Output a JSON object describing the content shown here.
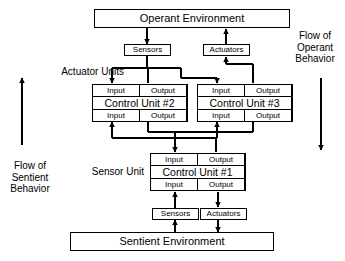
{
  "diagram": {
    "type": "block-diagram",
    "background_color": "#ffffff",
    "line_color": "#000000"
  },
  "environments": {
    "operant": "Operant Environment",
    "sentient": "Sentient Environment"
  },
  "interfaces": {
    "operant_sensors": "Sensors",
    "operant_actuators": "Actuators",
    "sentient_sensors": "Sensors",
    "sentient_actuators": "Actuators"
  },
  "control_units": [
    {
      "id": "cu2",
      "title": "Control Unit #2",
      "top_input": "Input",
      "top_output": "Output",
      "bottom_input": "Input",
      "bottom_output": "Output"
    },
    {
      "id": "cu3",
      "title": "Control Unit #3",
      "top_input": "Input",
      "top_output": "Output",
      "bottom_input": "Input",
      "bottom_output": "Output"
    },
    {
      "id": "cu1",
      "title": "Control Unit #1",
      "top_input": "Input",
      "top_output": "Output",
      "bottom_input": "Input",
      "bottom_output": "Output"
    }
  ],
  "labels": {
    "actuator_units": "Actuator Units",
    "sensor_unit": "Sensor Unit",
    "flow_operant": "Flow of\nOperant\nBehavior",
    "flow_sentient": "Flow of\nSentient\nBehavior"
  }
}
